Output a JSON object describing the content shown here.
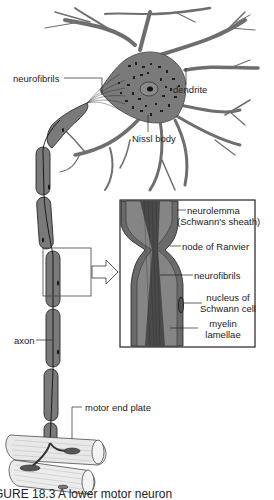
{
  "figure": {
    "title": "A lower motor neuron",
    "caption": "GURE 18.3   A lower motor neuron"
  },
  "labels": {
    "neurofibrils_main": "neurofibrils",
    "dendrite": "dendrite",
    "nissl_body": "Nissl body",
    "axon": "axon",
    "motor_end_plate": "motor end plate"
  },
  "inset": {
    "neurolemma_line1": "neurolemma",
    "neurolemma_line2": "(Schwann's sheath)",
    "node_of_ranvier": "node of Ranvier",
    "neurofibrils": "neurofibrils",
    "nucleus_line1": "nucleus of",
    "nucleus_line2": "Schwann cell",
    "myelin_line1": "myelin",
    "myelin_line2": "lamellae"
  },
  "colors": {
    "tissue": "#7a7a7a",
    "tissue_dark": "#3a3a3a",
    "outline": "#2a2a2a",
    "muscle": "#e8e8e8"
  }
}
